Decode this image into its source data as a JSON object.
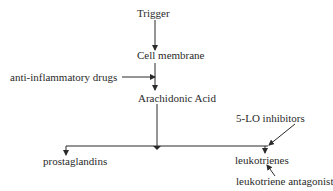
{
  "diagram": {
    "nodes": {
      "trigger": "Trigger",
      "cell_membrane": "Cell membrane",
      "anti_inflammatory": "anti-inflammatory drugs",
      "arachidonic_acid": "Arachidonic Acid",
      "lo_inhibitors": "5-LO inhibitors",
      "prostaglandins": "prostaglandins",
      "leukotrienes": "leukotrienes",
      "leukotriene_antagonist": "leukotriene antagonist"
    },
    "edges": [
      {
        "from": "Trigger",
        "to": "Cell membrane"
      },
      {
        "from": "Cell membrane",
        "to": "Arachidonic Acid"
      },
      {
        "from": "anti-inflammatory drugs",
        "to": "Cell membrane → Arachidonic Acid",
        "type": "inhibits"
      },
      {
        "from": "Arachidonic Acid",
        "to": "prostaglandins"
      },
      {
        "from": "Arachidonic Acid",
        "to": "leukotrienes"
      },
      {
        "from": "5-LO inhibitors",
        "to": "leukotrienes pathway",
        "type": "inhibits"
      },
      {
        "from": "leukotriene antagonist",
        "to": "leukotrienes",
        "type": "inhibits"
      }
    ],
    "colors": {
      "line": "#2a2a2a",
      "background": "#ffffff"
    }
  }
}
